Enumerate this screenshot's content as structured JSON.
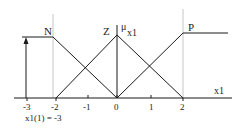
{
  "diagram": {
    "axis": {
      "label": "x1",
      "ticks": [
        "-3",
        "-2",
        "-1",
        "0",
        "1",
        "2"
      ],
      "y_label_mu": "μ",
      "y_label_sub": "x1"
    },
    "sets": [
      {
        "name": "N",
        "shape": "left-shoulder",
        "points": [
          [
            -3,
            1
          ],
          [
            -2,
            1
          ],
          [
            0,
            0
          ]
        ]
      },
      {
        "name": "Z",
        "shape": "triangle",
        "points": [
          [
            -2,
            0
          ],
          [
            0,
            1
          ],
          [
            2,
            0
          ]
        ]
      },
      {
        "name": "P",
        "shape": "right-shoulder",
        "points": [
          [
            0,
            0
          ],
          [
            2,
            1
          ],
          [
            3,
            1
          ]
        ]
      }
    ],
    "input": {
      "annotation": "x1(1) = -3",
      "value": -3
    },
    "colors": {
      "line": "#1a1a1a",
      "guide": "#b0b0b0",
      "background": "#ffffff"
    }
  }
}
